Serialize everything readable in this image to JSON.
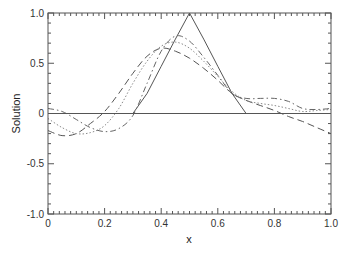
{
  "chart_data": {
    "type": "line",
    "title": "",
    "xlabel": "x",
    "ylabel": "Solution",
    "xlim": [
      0,
      1
    ],
    "ylim": [
      -1,
      1
    ],
    "grid": false,
    "legend": "none",
    "x_ticks": [
      "0",
      "0.2",
      "0.4",
      "0.6",
      "0.8",
      "1.0"
    ],
    "y_ticks": [
      "-1.0",
      "-0.5",
      "0",
      "0.5",
      "1.0"
    ],
    "x": [
      0,
      0.05,
      0.1,
      0.15,
      0.2,
      0.25,
      0.3,
      0.35,
      0.4,
      0.45,
      0.5,
      0.55,
      0.6,
      0.65,
      0.7,
      0.75,
      0.8,
      0.85,
      0.9,
      0.95,
      1.0
    ],
    "series": [
      {
        "name": "exact",
        "style": "solid",
        "values": [
          0,
          0,
          0,
          0,
          0,
          0,
          0,
          0.2,
          0.47,
          0.74,
          1.0,
          0.74,
          0.47,
          0.2,
          0,
          0,
          0,
          0,
          0,
          0,
          0
        ]
      },
      {
        "name": "long-dash",
        "style": "dashed",
        "values": [
          -0.17,
          -0.22,
          -0.2,
          -0.1,
          0.02,
          0.2,
          0.4,
          0.57,
          0.65,
          0.62,
          0.55,
          0.45,
          0.33,
          0.2,
          0.13,
          0.08,
          0.03,
          -0.03,
          -0.08,
          -0.14,
          -0.2
        ]
      },
      {
        "name": "dotted",
        "style": "dotted",
        "values": [
          -0.05,
          -0.14,
          -0.2,
          -0.19,
          -0.12,
          0.05,
          0.3,
          0.52,
          0.67,
          0.71,
          0.65,
          0.52,
          0.37,
          0.22,
          0.13,
          0.1,
          0.08,
          0.05,
          0.02,
          0.03,
          0.04
        ]
      },
      {
        "name": "dash-dot",
        "style": "dashdot",
        "values": [
          0.05,
          0.02,
          -0.06,
          -0.14,
          -0.18,
          -0.15,
          -0.02,
          0.3,
          0.62,
          0.77,
          0.72,
          0.56,
          0.38,
          0.2,
          0.15,
          0.15,
          0.15,
          0.12,
          0.05,
          0.04,
          0.05
        ]
      }
    ]
  }
}
